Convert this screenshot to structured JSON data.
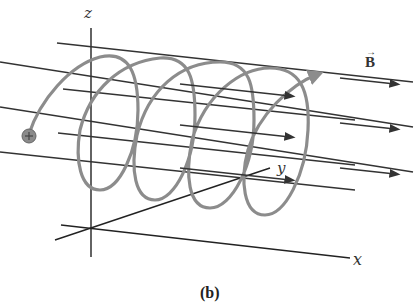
{
  "figure": {
    "caption": "(b)"
  },
  "axes": {
    "z_label": "z",
    "y_label": "y",
    "x_label": "x"
  },
  "field": {
    "label": "B",
    "vector_arrow": "→",
    "line_color": "#333333"
  },
  "particle": {
    "symbol": "+",
    "fill": "#8a8a8a"
  },
  "helix": {
    "color": "#8c8c8c",
    "loops": 4
  }
}
